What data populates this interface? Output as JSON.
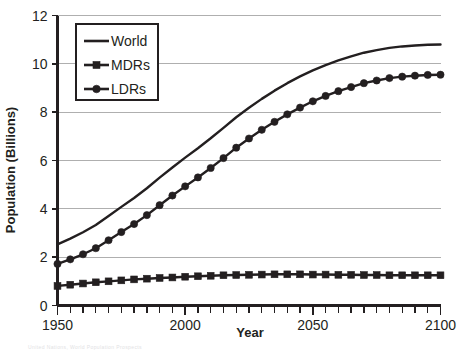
{
  "chart_data": {
    "type": "line",
    "title": "",
    "xlabel": "Year",
    "ylabel": "Population (Billions)",
    "xlim": [
      1950,
      2100
    ],
    "ylim": [
      0,
      12
    ],
    "grid": true,
    "legend_position": "top-left-inside",
    "x_tick_labels": [
      "1950",
      "2000",
      "2050",
      "2100"
    ],
    "x_tick_values": [
      1950,
      2000,
      2050,
      2100
    ],
    "x_minor_tick_step": 5,
    "y_tick_labels": [
      "0",
      "2",
      "4",
      "6",
      "8",
      "10",
      "12"
    ],
    "y_tick_values": [
      0,
      2,
      4,
      6,
      8,
      10,
      12
    ],
    "x": [
      1950,
      1955,
      1960,
      1965,
      1970,
      1975,
      1980,
      1985,
      1990,
      1995,
      2000,
      2005,
      2010,
      2015,
      2020,
      2025,
      2030,
      2035,
      2040,
      2045,
      2050,
      2055,
      2060,
      2065,
      2070,
      2075,
      2080,
      2085,
      2090,
      2095,
      2100
    ],
    "series": [
      {
        "name": "World",
        "marker": "none",
        "values": [
          2.53,
          2.77,
          3.03,
          3.33,
          3.7,
          4.08,
          4.45,
          4.85,
          5.29,
          5.71,
          6.12,
          6.51,
          6.92,
          7.35,
          7.79,
          8.18,
          8.55,
          8.89,
          9.2,
          9.48,
          9.73,
          9.95,
          10.14,
          10.31,
          10.46,
          10.57,
          10.66,
          10.72,
          10.76,
          10.79,
          10.8
        ]
      },
      {
        "name": "MDRs",
        "marker": "square",
        "values": [
          0.81,
          0.86,
          0.91,
          0.96,
          1.0,
          1.04,
          1.08,
          1.11,
          1.14,
          1.16,
          1.19,
          1.21,
          1.23,
          1.25,
          1.26,
          1.27,
          1.28,
          1.29,
          1.29,
          1.29,
          1.28,
          1.28,
          1.27,
          1.27,
          1.26,
          1.26,
          1.25,
          1.25,
          1.25,
          1.25,
          1.25
        ]
      },
      {
        "name": "LDRs",
        "marker": "circle",
        "values": [
          1.72,
          1.91,
          2.12,
          2.37,
          2.7,
          3.04,
          3.37,
          3.74,
          4.15,
          4.55,
          4.93,
          5.3,
          5.69,
          6.1,
          6.53,
          6.91,
          7.27,
          7.6,
          7.91,
          8.19,
          8.45,
          8.67,
          8.87,
          9.04,
          9.2,
          9.31,
          9.41,
          9.47,
          9.51,
          9.54,
          9.55
        ]
      }
    ]
  },
  "axes": {
    "x_title": "Year",
    "y_title": "Population (Billions)"
  },
  "legend": {
    "entries": [
      {
        "label": "World",
        "marker": "none"
      },
      {
        "label": "MDRs",
        "marker": "square"
      },
      {
        "label": "LDRs",
        "marker": "circle"
      }
    ]
  },
  "footnote": {
    "text": "United Nations, World Population Prospects"
  },
  "colors": {
    "ink": "#231f20",
    "grid": "#9b9b9b",
    "background": "#ffffff"
  }
}
